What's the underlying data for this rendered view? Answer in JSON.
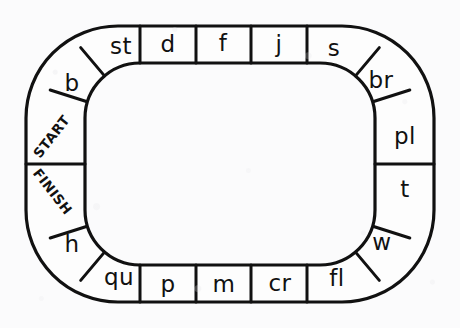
{
  "page": {
    "background_color": "#fbfbfc",
    "ink_color": "#111111",
    "cell_fill_color": "#fdfdfd"
  },
  "board": {
    "shape": "oval-racetrack",
    "total_cells": 18,
    "start_label": "START",
    "finish_label": "FINISH",
    "direction": "counterclockwise",
    "cells": [
      {
        "id": "c01",
        "label": "START",
        "kind": "marker",
        "side": "left",
        "rotation": -52
      },
      {
        "id": "c02",
        "label": "b",
        "kind": "blend",
        "side": "left",
        "rotation": 0
      },
      {
        "id": "c03",
        "label": "st",
        "kind": "blend",
        "side": "corner-tl",
        "rotation": 0
      },
      {
        "id": "c04",
        "label": "d",
        "kind": "blend",
        "side": "top",
        "rotation": 0
      },
      {
        "id": "c05",
        "label": "f",
        "kind": "blend",
        "side": "top",
        "rotation": 0
      },
      {
        "id": "c06",
        "label": "j",
        "kind": "blend",
        "side": "top",
        "rotation": 0
      },
      {
        "id": "c07",
        "label": "s",
        "kind": "blend",
        "side": "corner-tr",
        "rotation": 0
      },
      {
        "id": "c08",
        "label": "br",
        "kind": "blend",
        "side": "corner-tr",
        "rotation": 0
      },
      {
        "id": "c09",
        "label": "pl",
        "kind": "blend",
        "side": "right",
        "rotation": 0
      },
      {
        "id": "c10",
        "label": "t",
        "kind": "blend",
        "side": "right",
        "rotation": 0
      },
      {
        "id": "c11",
        "label": "w",
        "kind": "blend",
        "side": "corner-br",
        "rotation": 0
      },
      {
        "id": "c12",
        "label": "fl",
        "kind": "blend",
        "side": "corner-br",
        "rotation": 0
      },
      {
        "id": "c13",
        "label": "cr",
        "kind": "blend",
        "side": "bottom",
        "rotation": 0
      },
      {
        "id": "c14",
        "label": "m",
        "kind": "blend",
        "side": "bottom",
        "rotation": 0
      },
      {
        "id": "c15",
        "label": "p",
        "kind": "blend",
        "side": "bottom",
        "rotation": 0
      },
      {
        "id": "c16",
        "label": "qu",
        "kind": "blend",
        "side": "corner-bl",
        "rotation": 0
      },
      {
        "id": "c17",
        "label": "h",
        "kind": "blend",
        "side": "corner-bl",
        "rotation": 0
      },
      {
        "id": "c18",
        "label": "FINISH",
        "kind": "marker",
        "side": "left",
        "rotation": 52
      }
    ],
    "top_row_labels": [
      "st",
      "d",
      "f",
      "j",
      "s"
    ],
    "bottom_row_labels": [
      "qu",
      "p",
      "m",
      "cr",
      "fl"
    ],
    "left_column_labels": [
      "b",
      "START",
      "FINISH",
      "h"
    ],
    "right_column_labels": [
      "br",
      "pl",
      "t",
      "w"
    ]
  }
}
